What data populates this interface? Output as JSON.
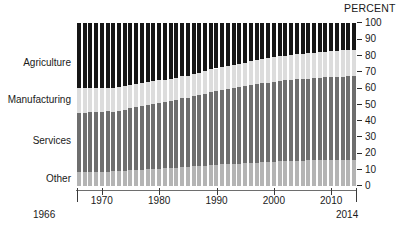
{
  "chart": {
    "type": "stacked-bar",
    "percent_header": "PERCENT",
    "start_year_label": "1966",
    "end_year_label": "2014"
  },
  "chart_data": {
    "type": "bar",
    "stacked": true,
    "title": "",
    "subtitle": "",
    "xlabel": "",
    "ylabel": "PERCENT",
    "ylim": [
      0,
      100
    ],
    "grid": false,
    "legend_position": "left-inline",
    "yticks": [
      0,
      10,
      20,
      30,
      40,
      50,
      60,
      70,
      80,
      90,
      100
    ],
    "ytick_labels": [
      "0",
      "10",
      "20",
      "30",
      "40",
      "50",
      "60",
      "70",
      "80",
      "90",
      "100"
    ],
    "xticks": [
      1970,
      1980,
      1990,
      2000,
      2010
    ],
    "xtick_labels": [
      "1970",
      "1980",
      "1990",
      "2000",
      "2010"
    ],
    "x_edge_labels": [
      "1966",
      "2014"
    ],
    "categories": [
      1966,
      1967,
      1968,
      1969,
      1970,
      1971,
      1972,
      1973,
      1974,
      1975,
      1976,
      1977,
      1978,
      1979,
      1980,
      1981,
      1982,
      1983,
      1984,
      1985,
      1986,
      1987,
      1988,
      1989,
      1990,
      1991,
      1992,
      1993,
      1994,
      1995,
      1996,
      1997,
      1998,
      1999,
      2000,
      2001,
      2002,
      2003,
      2004,
      2005,
      2006,
      2007,
      2008,
      2009,
      2010,
      2011,
      2012,
      2013,
      2014
    ],
    "series": [
      {
        "name": "Other",
        "color": "#b4b4b4",
        "stack_order": 0,
        "values": [
          8.5,
          8.5,
          8.6,
          8.7,
          8.8,
          8.9,
          9.0,
          9.2,
          9.4,
          9.6,
          9.8,
          10.0,
          10.2,
          10.4,
          10.6,
          10.9,
          11.1,
          11.3,
          11.5,
          11.8,
          12.0,
          12.3,
          12.5,
          12.8,
          13.0,
          13.2,
          13.4,
          13.6,
          13.8,
          14.0,
          14.2,
          14.3,
          14.5,
          14.7,
          14.9,
          15.1,
          15.3,
          15.4,
          15.5,
          15.6,
          15.7,
          15.8,
          15.9,
          16.0,
          16.0,
          16.1,
          16.1,
          16.2,
          16.2
        ]
      },
      {
        "name": "Services",
        "color": "#6e6e6e",
        "stack_order": 1,
        "values": [
          36.5,
          36.6,
          36.6,
          36.7,
          36.8,
          36.9,
          36.4,
          36.8,
          37.5,
          38.2,
          38.7,
          39.1,
          39.6,
          40.1,
          40.5,
          40.6,
          40.8,
          41.4,
          42.2,
          42.5,
          43.1,
          43.6,
          44.2,
          44.8,
          45.1,
          45.5,
          45.9,
          46.4,
          46.8,
          47.2,
          47.6,
          48.1,
          48.5,
          48.8,
          49.1,
          49.3,
          49.5,
          49.8,
          49.9,
          50.0,
          50.2,
          50.4,
          50.5,
          50.6,
          50.7,
          50.8,
          50.9,
          51.0,
          51.0
        ]
      },
      {
        "name": "Manufacturing",
        "color": "#dcdcdc",
        "stack_order": 2,
        "values": [
          15.0,
          14.9,
          14.8,
          14.7,
          14.6,
          14.5,
          14.7,
          14.6,
          14.5,
          14.3,
          14.2,
          14.1,
          14.0,
          13.9,
          13.8,
          13.8,
          13.7,
          13.6,
          13.5,
          13.5,
          13.6,
          13.7,
          13.8,
          13.9,
          14.0,
          14.1,
          14.2,
          14.3,
          14.4,
          14.5,
          14.6,
          14.7,
          14.8,
          14.9,
          15.0,
          15.1,
          15.2,
          15.3,
          15.4,
          15.5,
          15.6,
          15.7,
          15.8,
          15.9,
          16.0,
          16.1,
          16.2,
          16.3,
          16.4
        ]
      },
      {
        "name": "Agriculture",
        "color": "#161616",
        "stack_order": 3,
        "values": [
          40.0,
          40.0,
          40.0,
          39.9,
          39.8,
          39.7,
          39.9,
          39.4,
          38.6,
          37.9,
          37.3,
          36.8,
          36.2,
          35.6,
          35.1,
          34.7,
          34.4,
          33.7,
          32.8,
          32.2,
          31.3,
          30.4,
          29.5,
          28.5,
          27.9,
          27.2,
          26.5,
          25.7,
          25.0,
          24.3,
          23.6,
          22.9,
          22.2,
          21.6,
          21.0,
          20.5,
          20.0,
          19.5,
          19.2,
          18.9,
          18.5,
          18.1,
          17.8,
          17.5,
          17.3,
          17.0,
          16.8,
          16.5,
          16.4
        ]
      }
    ]
  },
  "series_labels": [
    {
      "name": "Agriculture",
      "text": "Agriculture"
    },
    {
      "name": "Manufacturing",
      "text": "Manufacturing"
    },
    {
      "name": "Services",
      "text": "Services"
    },
    {
      "name": "Other",
      "text": "Other"
    }
  ]
}
